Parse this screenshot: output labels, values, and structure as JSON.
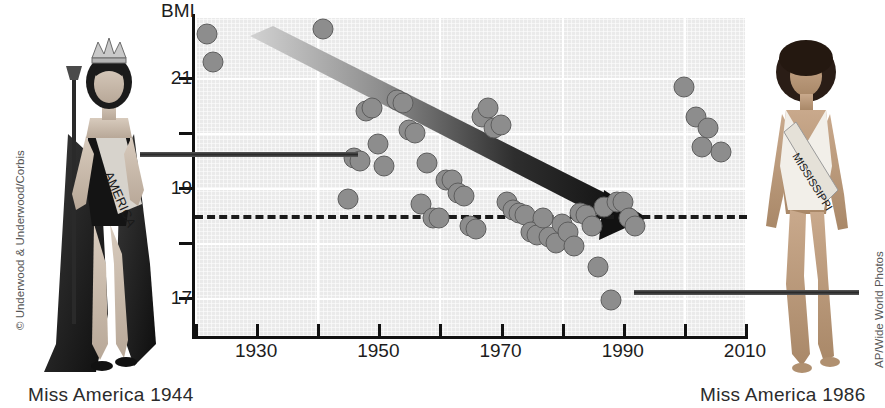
{
  "figure": {
    "left_caption": "Miss America 1944",
    "right_caption": "Miss America 1986",
    "left_credit": "© Underwood & Underwood/Corbis",
    "right_credit": "AP/Wide World Photos",
    "left_sash_text": "AMERICA",
    "right_sash_text": "MISSISSIPPI"
  },
  "colors": {
    "plot_background": "#eaeaea",
    "gridline": "#ffffff",
    "dot_fill": "#8d8d8d",
    "dot_stroke": "#5d5d5d",
    "axis": "#111111",
    "trend_arrow": "#1a1a1a",
    "reference_line": "#1a1a1a"
  },
  "chart_data": {
    "type": "scatter",
    "title": "",
    "xlabel": "",
    "ylabel": "BMI",
    "xlim": [
      1920,
      2010
    ],
    "ylim": [
      16.3,
      22.1
    ],
    "grid": true,
    "legend": "none",
    "xticks": [
      1920,
      1930,
      1940,
      1950,
      1960,
      1970,
      1980,
      1990,
      2000,
      2010
    ],
    "xtick_labels": [
      "",
      "1930",
      "",
      "1950",
      "",
      "1970",
      "",
      "1990",
      "",
      "2010"
    ],
    "yticks": [
      17,
      18,
      19,
      20,
      21
    ],
    "ytick_labels": [
      "17",
      "",
      "19",
      "",
      "21"
    ],
    "annotations": [
      {
        "name": "underweight-reference-line",
        "type": "hline",
        "y": 18.5,
        "style": "dashed",
        "label": ""
      },
      {
        "name": "trend-arrow",
        "type": "arrow",
        "x_start": 1929,
        "y_start": 21.5,
        "x_end": 1995,
        "y_end": 17.6
      },
      {
        "name": "left-photo-connector",
        "type": "pointer",
        "to_x": 1946,
        "to_y": 19.55
      },
      {
        "name": "right-photo-connector",
        "type": "pointer",
        "to_x": 1988,
        "to_y": 16.95
      }
    ],
    "points": [
      {
        "x": 1922,
        "y": 21.8
      },
      {
        "x": 1923,
        "y": 21.3
      },
      {
        "x": 1941,
        "y": 21.9
      },
      {
        "x": 1945,
        "y": 18.8
      },
      {
        "x": 1946,
        "y": 19.55
      },
      {
        "x": 1947,
        "y": 19.5
      },
      {
        "x": 1948,
        "y": 20.4
      },
      {
        "x": 1949,
        "y": 20.45
      },
      {
        "x": 1950,
        "y": 19.8
      },
      {
        "x": 1951,
        "y": 19.4
      },
      {
        "x": 1953,
        "y": 20.6
      },
      {
        "x": 1954,
        "y": 20.55
      },
      {
        "x": 1955,
        "y": 20.05
      },
      {
        "x": 1956,
        "y": 20.0
      },
      {
        "x": 1957,
        "y": 18.7
      },
      {
        "x": 1958,
        "y": 19.45
      },
      {
        "x": 1959,
        "y": 18.45
      },
      {
        "x": 1960,
        "y": 18.45
      },
      {
        "x": 1961,
        "y": 19.15
      },
      {
        "x": 1962,
        "y": 19.15
      },
      {
        "x": 1963,
        "y": 18.9
      },
      {
        "x": 1964,
        "y": 18.85
      },
      {
        "x": 1965,
        "y": 18.3
      },
      {
        "x": 1966,
        "y": 18.25
      },
      {
        "x": 1967,
        "y": 20.3
      },
      {
        "x": 1968,
        "y": 20.45
      },
      {
        "x": 1969,
        "y": 20.1
      },
      {
        "x": 1970,
        "y": 20.15
      },
      {
        "x": 1971,
        "y": 18.75
      },
      {
        "x": 1972,
        "y": 18.6
      },
      {
        "x": 1973,
        "y": 18.55
      },
      {
        "x": 1974,
        "y": 18.5
      },
      {
        "x": 1975,
        "y": 18.2
      },
      {
        "x": 1976,
        "y": 18.15
      },
      {
        "x": 1977,
        "y": 18.45
      },
      {
        "x": 1978,
        "y": 18.1
      },
      {
        "x": 1979,
        "y": 18.0
      },
      {
        "x": 1980,
        "y": 18.35
      },
      {
        "x": 1981,
        "y": 18.2
      },
      {
        "x": 1982,
        "y": 17.95
      },
      {
        "x": 1983,
        "y": 18.55
      },
      {
        "x": 1984,
        "y": 18.5
      },
      {
        "x": 1985,
        "y": 18.3
      },
      {
        "x": 1986,
        "y": 17.55
      },
      {
        "x": 1987,
        "y": 18.65
      },
      {
        "x": 1988,
        "y": 16.95
      },
      {
        "x": 1989,
        "y": 18.75
      },
      {
        "x": 1990,
        "y": 18.75
      },
      {
        "x": 1991,
        "y": 18.45
      },
      {
        "x": 1992,
        "y": 18.3
      },
      {
        "x": 2000,
        "y": 20.85
      },
      {
        "x": 2002,
        "y": 20.3
      },
      {
        "x": 2004,
        "y": 20.1
      },
      {
        "x": 2003,
        "y": 19.75
      },
      {
        "x": 2006,
        "y": 19.65
      }
    ]
  }
}
